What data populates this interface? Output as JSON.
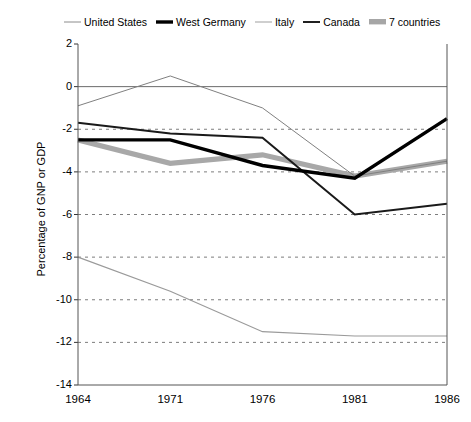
{
  "chart_data": {
    "type": "line",
    "title": "",
    "xlabel": "",
    "ylabel": "Percentage of GNP or GDP",
    "categories": [
      "1964",
      "1971",
      "1976",
      "1981",
      "1986"
    ],
    "xlim": [
      0,
      4
    ],
    "ylim": [
      -14,
      2
    ],
    "ytick_values": [
      2,
      0,
      -2,
      -4,
      -6,
      -8,
      -10,
      -12,
      -14
    ],
    "grid": "horizontal dashed gridlines at every y tick; solid line at y=0",
    "legend_position": "top",
    "series": [
      {
        "name": "United States",
        "style": "thin solid gray",
        "color": "#808080",
        "values": [
          -0.9,
          0.5,
          -1.0,
          -4.2,
          -3.5
        ]
      },
      {
        "name": "West Germany",
        "style": "thick solid black",
        "color": "#000000",
        "values": [
          -2.5,
          -2.5,
          -3.7,
          -4.3,
          -1.5
        ]
      },
      {
        "name": "Italy",
        "style": "thin light gray",
        "color": "#9a9a9a",
        "values": [
          -8.0,
          -9.6,
          -11.5,
          -11.7,
          -11.7
        ]
      },
      {
        "name": "Canada",
        "style": "medium solid black",
        "color": "#1a1a1a",
        "values": [
          -1.7,
          -2.2,
          -2.4,
          -6.0,
          -5.5
        ]
      },
      {
        "name": "7 countries",
        "style": "thick gray band",
        "color": "#a8a8a8",
        "values": [
          -2.5,
          -3.6,
          -3.2,
          -4.2,
          -3.5
        ]
      }
    ]
  },
  "legend": {
    "items": [
      {
        "label": "United States",
        "swatch": "thin-line-swatch"
      },
      {
        "label": "West Germany",
        "swatch": "thick-line-swatch"
      },
      {
        "label": "Italy",
        "swatch": "light-line-swatch"
      },
      {
        "label": "Canada",
        "swatch": "medium-line-swatch"
      },
      {
        "label": "7 countries",
        "swatch": "band-swatch"
      }
    ]
  },
  "axes": {
    "y_title": "Percentage of GNP or GDP",
    "y_ticks": [
      "2",
      "0",
      "-2",
      "-4",
      "-6",
      "-8",
      "-10",
      "-12",
      "-14"
    ],
    "x_ticks": [
      "1964",
      "1971",
      "1976",
      "1981",
      "1986"
    ]
  }
}
